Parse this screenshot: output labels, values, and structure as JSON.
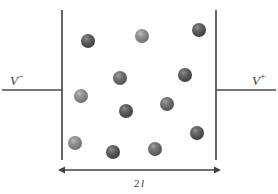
{
  "figure": {
    "canvas": {
      "width": 278,
      "height": 194,
      "background": "#ffffff"
    },
    "colors": {
      "line": "#3f3f3f",
      "wire": "#4a4a4a",
      "sphere_dark": "#4a4a4a",
      "sphere_mid": "#5e5e5e",
      "sphere_light": "#7a7a7a",
      "sphere_highlight": "#b8b8b8",
      "text": "#3a3a3a"
    }
  },
  "labels": {
    "left_electrode": {
      "symbol": "V",
      "sign": "−",
      "full": "V−"
    },
    "right_electrode": {
      "symbol": "V",
      "sign": "+",
      "full": "V+"
    },
    "dimension": {
      "number": "2",
      "symbol": "l",
      "full": "2 l"
    }
  },
  "geometry": {
    "left_plate": {
      "x": 62,
      "y_top": 10,
      "y_bottom": 160
    },
    "right_plate": {
      "x": 216,
      "y_top": 10,
      "y_bottom": 160
    },
    "left_wire": {
      "x_start": 2,
      "x_end": 62,
      "y": 90
    },
    "right_wire": {
      "x_start": 216,
      "x_end": 276,
      "y": 90
    },
    "dimension_line": {
      "x_start": 63,
      "x_end": 216,
      "y": 170
    }
  },
  "particles": [
    {
      "id": "p1",
      "cx": 88,
      "cy": 41,
      "r": 7.0,
      "shade": "dark"
    },
    {
      "id": "p2",
      "cx": 142,
      "cy": 36,
      "r": 7.0,
      "shade": "light"
    },
    {
      "id": "p3",
      "cx": 199,
      "cy": 30,
      "r": 7.0,
      "shade": "dark"
    },
    {
      "id": "p4",
      "cx": 120,
      "cy": 78,
      "r": 7.0,
      "shade": "mid"
    },
    {
      "id": "p5",
      "cx": 185,
      "cy": 75,
      "r": 7.0,
      "shade": "dark"
    },
    {
      "id": "p6",
      "cx": 81,
      "cy": 96,
      "r": 7.0,
      "shade": "light"
    },
    {
      "id": "p7",
      "cx": 126,
      "cy": 111,
      "r": 7.0,
      "shade": "dark"
    },
    {
      "id": "p8",
      "cx": 167,
      "cy": 104,
      "r": 7.0,
      "shade": "mid"
    },
    {
      "id": "p9",
      "cx": 197,
      "cy": 133,
      "r": 7.0,
      "shade": "dark"
    },
    {
      "id": "p10",
      "cx": 75,
      "cy": 143,
      "r": 7.0,
      "shade": "light"
    },
    {
      "id": "p11",
      "cx": 113,
      "cy": 152,
      "r": 7.0,
      "shade": "dark"
    },
    {
      "id": "p12",
      "cx": 155,
      "cy": 149,
      "r": 7.0,
      "shade": "mid"
    }
  ]
}
